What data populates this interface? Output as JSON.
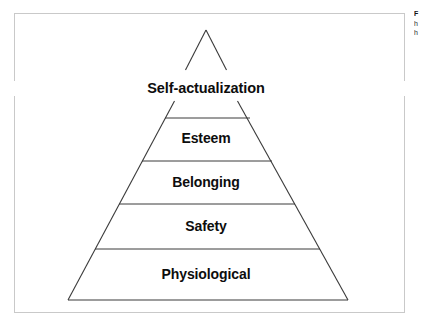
{
  "figure": {
    "name": "maslow-hierarchy-of-needs-pyramid",
    "frame": {
      "border_color": "#c9c9c9",
      "background": "#ffffff"
    },
    "stroke_color": "#3a3a3a",
    "text_color": "#0d0d0d",
    "levels": [
      {
        "id": "self-actualization",
        "rank": 5,
        "label": "Self-actualization"
      },
      {
        "id": "esteem",
        "rank": 4,
        "label": "Esteem"
      },
      {
        "id": "belonging",
        "rank": 3,
        "label": "Belonging"
      },
      {
        "id": "safety",
        "rank": 2,
        "label": "Safety"
      },
      {
        "id": "physiological",
        "rank": 1,
        "label": "Physiological"
      }
    ]
  },
  "caption": {
    "line1": "F",
    "line2": "h",
    "line3": "h"
  }
}
